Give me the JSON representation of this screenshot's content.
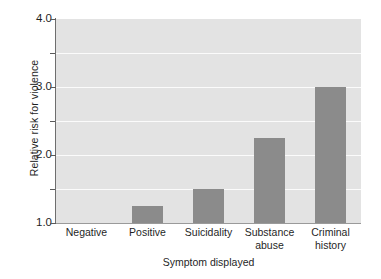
{
  "chart_data": {
    "type": "bar",
    "title": "",
    "subtitle": "",
    "xlabel": "Symptom displayed",
    "ylabel": "Relative risk for violence",
    "categories": [
      "Negative",
      "Positive",
      "Suicidality",
      "Substance abuse",
      "Criminal history"
    ],
    "category_lines": [
      [
        "Negative"
      ],
      [
        "Positive"
      ],
      [
        "Suicidality"
      ],
      [
        "Substance",
        "abuse"
      ],
      [
        "Criminal",
        "history"
      ]
    ],
    "values": [
      1.0,
      1.25,
      1.5,
      2.25,
      3.0
    ],
    "ylim": [
      1.0,
      4.0
    ],
    "ytick_labels": [
      "1.0",
      "2.0",
      "3.0",
      "4.0"
    ],
    "ytick_values": [
      1.0,
      2.0,
      3.0,
      4.0
    ],
    "yminor_tick_values": [
      1.5,
      2.5,
      3.5
    ],
    "gridlines_at": [
      1.5,
      2.0,
      2.5,
      3.0,
      3.5
    ],
    "grid": true,
    "legend": "none",
    "bar_color": "#8b8b8b",
    "plot_background": "#e3e3e3",
    "gridline_color": "#fbfbfb",
    "axis_color": "#6e6e6e"
  }
}
